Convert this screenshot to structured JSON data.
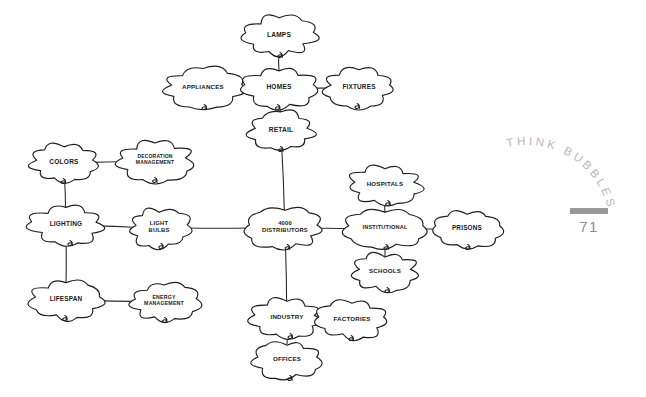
{
  "page": {
    "section_label": "THINK BUBBLES",
    "page_number": "71",
    "background_color": "#ffffff",
    "ink_color": "#1f1f1f",
    "marginalia_color": "#b7b7b7"
  },
  "diagram": {
    "title": "THINK BUBBLES",
    "type": "hand-drawn-mind-map",
    "center_node": "4000 DISTRIBUTORS",
    "nodes": [
      {
        "id": "lamps",
        "label": "LAMPS",
        "x": 279,
        "y": 36,
        "rx": 32,
        "ry": 18,
        "font": 6.6,
        "lines": [
          "LAMPS"
        ]
      },
      {
        "id": "appliances",
        "label": "APPLIANCES",
        "x": 203,
        "y": 88,
        "rx": 36,
        "ry": 18,
        "font": 6.2,
        "lines": [
          "APPLIANCES"
        ]
      },
      {
        "id": "homes",
        "label": "HOMES",
        "x": 279,
        "y": 88,
        "rx": 32,
        "ry": 18,
        "font": 6.6,
        "lines": [
          "HOMES"
        ]
      },
      {
        "id": "fixtures",
        "label": "FIXTURES",
        "x": 359,
        "y": 88,
        "rx": 31,
        "ry": 17,
        "font": 6.4,
        "lines": [
          "FIXTURES"
        ]
      },
      {
        "id": "retail",
        "label": "RETAIL",
        "x": 281,
        "y": 131,
        "rx": 29,
        "ry": 17,
        "font": 6.6,
        "lines": [
          "RETAIL"
        ]
      },
      {
        "id": "colors",
        "label": "COLORS",
        "x": 64,
        "y": 163,
        "rx": 30,
        "ry": 17,
        "font": 6.6,
        "lines": [
          "COLORS"
        ]
      },
      {
        "id": "decoration",
        "label": "DECORATION MANAGEMENT",
        "x": 155,
        "y": 161,
        "rx": 33,
        "ry": 18,
        "font": 5.0,
        "lines": [
          "DECORATION",
          "MANAGEMENT"
        ]
      },
      {
        "id": "hospitals",
        "label": "HOSPITALS",
        "x": 385,
        "y": 185,
        "rx": 32,
        "ry": 17,
        "font": 6.2,
        "lines": [
          "HOSPITALS"
        ]
      },
      {
        "id": "lighting",
        "label": "LIGHTING",
        "x": 66,
        "y": 225,
        "rx": 31,
        "ry": 17,
        "font": 6.5,
        "lines": [
          "LIGHTING"
        ]
      },
      {
        "id": "lightbulbs",
        "label": "LIGHT BULBS",
        "x": 159,
        "y": 228,
        "rx": 27,
        "ry": 17,
        "font": 5.8,
        "lines": [
          "LIGHT",
          "BULBS"
        ]
      },
      {
        "id": "distributors",
        "label": "4000 DISTRIBUTORS",
        "x": 285,
        "y": 228,
        "rx": 34,
        "ry": 18,
        "font": 5.8,
        "lines": [
          "4000",
          "DISTRIBUTORS"
        ]
      },
      {
        "id": "institutional",
        "label": "INSTITUTIONAL",
        "x": 385,
        "y": 229,
        "rx": 34,
        "ry": 17,
        "font": 5.6,
        "lines": [
          "INSTITUTIONAL"
        ]
      },
      {
        "id": "prisons",
        "label": "PRISONS",
        "x": 467,
        "y": 229,
        "rx": 30,
        "ry": 17,
        "font": 6.4,
        "lines": [
          "PRISONS"
        ]
      },
      {
        "id": "schools",
        "label": "SCHOOLS",
        "x": 385,
        "y": 272,
        "rx": 29,
        "ry": 17,
        "font": 6.2,
        "lines": [
          "SCHOOLS"
        ]
      },
      {
        "id": "lifespan",
        "label": "LIFESPAN",
        "x": 66,
        "y": 300,
        "rx": 30,
        "ry": 17,
        "font": 6.4,
        "lines": [
          "LIFESPAN"
        ]
      },
      {
        "id": "energy",
        "label": "ENERGY MANAGEMENT",
        "x": 164,
        "y": 302,
        "rx": 29,
        "ry": 17,
        "font": 5.2,
        "lines": [
          "ENERGY",
          "MANAGEMENT"
        ]
      },
      {
        "id": "industry",
        "label": "INDUSTRY",
        "x": 287,
        "y": 318,
        "rx": 31,
        "ry": 17,
        "font": 6.2,
        "lines": [
          "INDUSTRY"
        ]
      },
      {
        "id": "factories",
        "label": "FACTORIES",
        "x": 352,
        "y": 320,
        "rx": 31,
        "ry": 17,
        "font": 6.2,
        "lines": [
          "FACTORIES"
        ]
      },
      {
        "id": "offices",
        "label": "OFFICES",
        "x": 287,
        "y": 360,
        "rx": 29,
        "ry": 17,
        "font": 6.2,
        "lines": [
          "OFFICES"
        ]
      }
    ],
    "edges": [
      {
        "from": "lamps",
        "to": "homes"
      },
      {
        "from": "appliances",
        "to": "homes"
      },
      {
        "from": "homes",
        "to": "fixtures"
      },
      {
        "from": "homes",
        "to": "retail"
      },
      {
        "from": "retail",
        "to": "distributors"
      },
      {
        "from": "colors",
        "to": "decoration"
      },
      {
        "from": "colors",
        "to": "lighting"
      },
      {
        "from": "lighting",
        "to": "lightbulbs"
      },
      {
        "from": "lighting",
        "to": "lifespan"
      },
      {
        "from": "lifespan",
        "to": "energy"
      },
      {
        "from": "lightbulbs",
        "to": "distributors"
      },
      {
        "from": "distributors",
        "to": "institutional"
      },
      {
        "from": "hospitals",
        "to": "institutional"
      },
      {
        "from": "institutional",
        "to": "prisons"
      },
      {
        "from": "institutional",
        "to": "schools"
      },
      {
        "from": "distributors",
        "to": "industry"
      },
      {
        "from": "industry",
        "to": "factories"
      },
      {
        "from": "industry",
        "to": "offices"
      }
    ]
  }
}
